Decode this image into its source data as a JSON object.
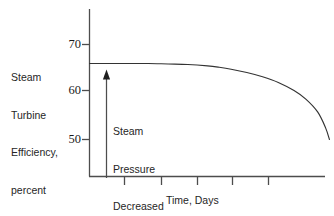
{
  "chart_data": {
    "type": "line",
    "title": "",
    "xlabel": "Time, Days",
    "ylabel": "Steam Turbine Efficiency, percent",
    "ylabel_lines": [
      "Steam",
      "Turbine",
      "Efficiency,",
      "percent"
    ],
    "ylim": [
      44,
      74
    ],
    "xlim": [
      0,
      6
    ],
    "grid": false,
    "legend": null,
    "yticks": [
      70,
      60,
      50
    ],
    "ytick_labels": [
      "70",
      "60",
      "50"
    ],
    "xticks": [
      1,
      2,
      3,
      4,
      5
    ],
    "xtick_labels": [
      "",
      "",
      "",
      "",
      ""
    ],
    "series": [
      {
        "name": "Steam turbine efficiency",
        "x": [
          0.0,
          0.5,
          1.0,
          1.5,
          2.0,
          2.5,
          3.0,
          3.3,
          3.6,
          4.0,
          4.4,
          4.8,
          5.2,
          5.5,
          5.8,
          6.0,
          6.1
        ],
        "values": [
          66.0,
          66.0,
          66.0,
          66.0,
          65.9,
          65.8,
          65.5,
          65.2,
          64.8,
          64.1,
          63.2,
          62.0,
          60.3,
          58.5,
          55.8,
          52.5,
          50.0
        ]
      }
    ],
    "annotations": [
      {
        "name": "steam-pressure-decreased",
        "lines": [
          "Steam",
          "Pressure",
          "Decreased"
        ],
        "arrow": {
          "type": "vertical-arrow-up",
          "x": 0.47,
          "y_start": 44.5,
          "y_end": 63.5
        }
      }
    ],
    "colors": {
      "axis": "#4d4d4d",
      "curve": "#333333",
      "arrow": "#4d4d4d",
      "text": "#262626",
      "background": "#ffffff"
    }
  },
  "labels": {
    "y_axis_title_lines": [
      "Steam",
      "Turbine",
      "Efficiency,",
      "percent"
    ],
    "x_axis_title": "Time, Days",
    "annotation_lines": [
      "Steam",
      "Pressure",
      "Decreased"
    ],
    "ytick_70": "70",
    "ytick_60": "60",
    "ytick_50": "50"
  }
}
